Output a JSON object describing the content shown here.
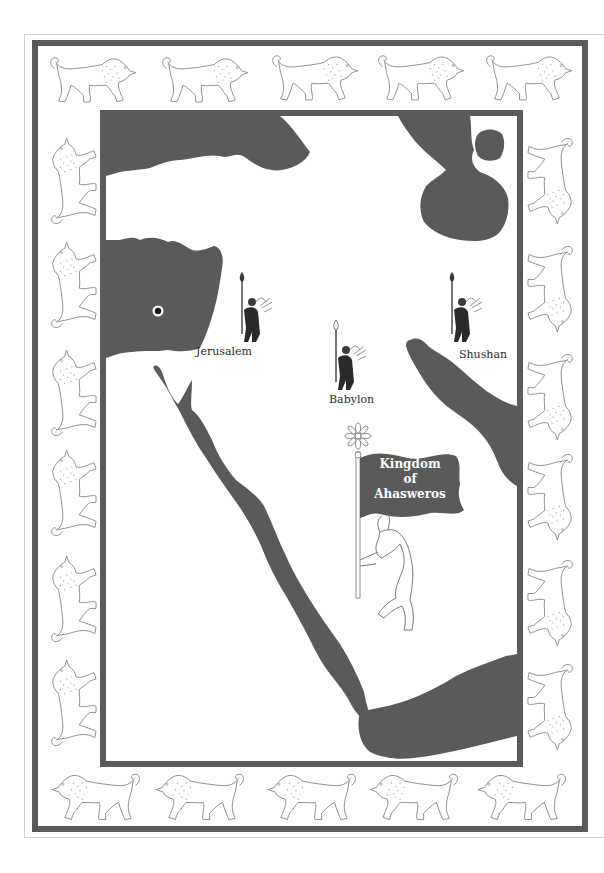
{
  "map": {
    "title_banner": {
      "line1": "Kingdom",
      "line2": "of",
      "line3": "Ahasweros"
    },
    "cities": [
      {
        "name": "Jerusalem",
        "marker": "warrior-icon"
      },
      {
        "name": "Babylon",
        "marker": "warrior-icon"
      },
      {
        "name": "Shushan",
        "marker": "warrior-icon"
      }
    ],
    "location_marker": "circle-dot-icon",
    "colors": {
      "frame": "#5a5a5a",
      "water": "#5a5a5a",
      "land": "#ffffff",
      "lion_outline": "#8a8a8a"
    },
    "border_decoration": "lion-frieze"
  }
}
